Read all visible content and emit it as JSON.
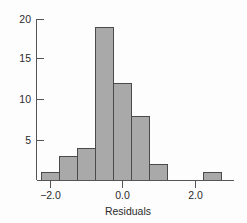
{
  "chart_data": {
    "type": "bar",
    "title": "",
    "subtitle": "",
    "xlabel": "Residuals",
    "ylabel": "",
    "bin_width": 0.5,
    "bin_edges": [
      -2.25,
      -1.75,
      -1.25,
      -0.75,
      -0.25,
      0.25,
      0.75,
      1.25,
      1.75,
      2.25,
      2.75
    ],
    "bin_centers": [
      -2.0,
      -1.5,
      -1.0,
      -0.5,
      0.0,
      0.5,
      1.0,
      1.5,
      2.0,
      2.5
    ],
    "categories": [
      "-2.25 to -1.75",
      "-1.75 to -1.25",
      "-1.25 to -0.75",
      "-0.75 to -0.25",
      "-0.25 to 0.25",
      "0.25 to 0.75",
      "0.75 to 1.25",
      "1.25 to 1.75",
      "1.75 to 2.25",
      "2.25 to 2.75"
    ],
    "values": [
      1,
      3,
      4,
      19,
      12,
      8,
      2,
      0,
      0,
      1
    ],
    "xlim": [
      -2.6,
      2.95
    ],
    "ylim": [
      0,
      20.8
    ],
    "xticks": [
      -2.0,
      0.0,
      2.0
    ],
    "xtick_labels": [
      "−2.0",
      "0.0",
      "2.0"
    ],
    "yticks": [
      5,
      10,
      15,
      20
    ],
    "ytick_labels": [
      "5",
      "10",
      "15",
      "20"
    ],
    "grid": false,
    "legend": "none",
    "bar_fill_color": "#a9a9a9",
    "bar_edge_color": "#4a4a4a",
    "axis_color": "#555555",
    "background_color": "#ffffff"
  },
  "figure": {
    "xaxis_title": "Residuals",
    "ytick_0": "5",
    "ytick_1": "10",
    "ytick_2": "15",
    "ytick_3": "20",
    "xtick_0": "−2.0",
    "xtick_1": "0.0",
    "xtick_2": "2.0"
  }
}
